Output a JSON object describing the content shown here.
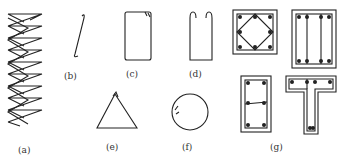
{
  "figure": {
    "labels": {
      "a": "(a)",
      "b": "(b)",
      "c": "(c)",
      "d": "(d)",
      "e": "(e)",
      "f": "(f)",
      "g": "(g)"
    },
    "descriptions": {
      "a": "spiral stirrup",
      "b": "single-leg tie with hooks",
      "c": "closed rectangular stirrup",
      "d": "open U stirrup",
      "e": "triangular stirrup",
      "f": "circular stirrup",
      "g": "compound stirrups in column/beam sections"
    },
    "colors": {
      "stroke": "#222222",
      "background": "#ffffff"
    }
  }
}
